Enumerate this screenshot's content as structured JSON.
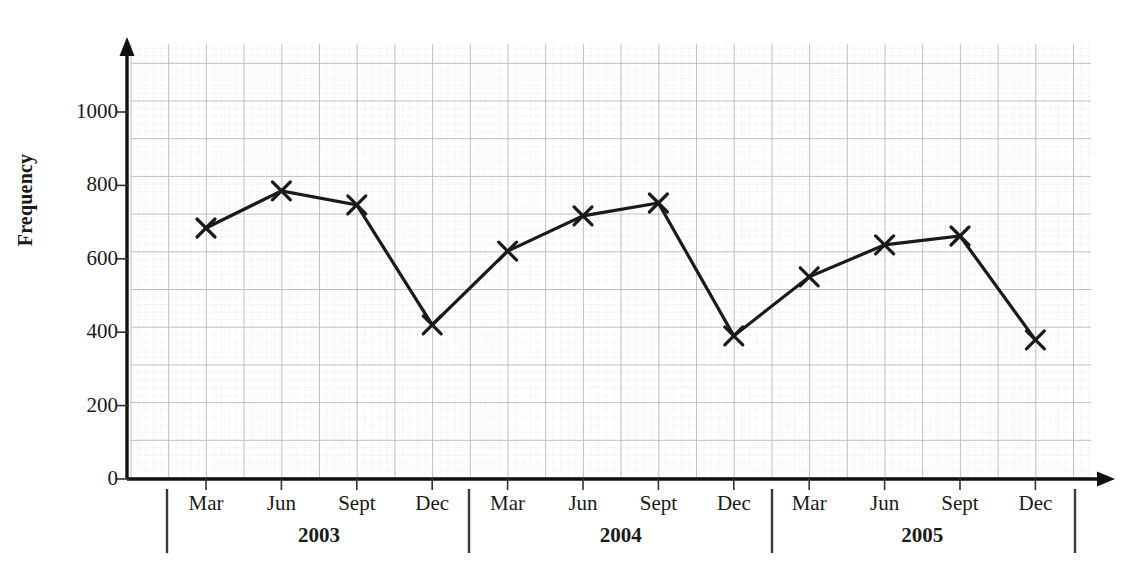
{
  "chart_data": {
    "type": "line",
    "title": "",
    "xlabel": "",
    "ylabel": "Frequency",
    "ylim": [
      0,
      1150
    ],
    "y_ticks": [
      0,
      200,
      400,
      600,
      800,
      1000
    ],
    "y_tick_labels": [
      "0",
      "200",
      "400",
      "600",
      "800",
      "1000"
    ],
    "grid": true,
    "legend": "none",
    "marker": "x",
    "line_color": "#1a1a1a",
    "grid_major_color": "#b9b9bd",
    "grid_minor_color": "#d8d8dd",
    "axis_color": "#111111",
    "categories": [
      "Mar 2003",
      "Jun 2003",
      "Sept 2003",
      "Dec 2003",
      "Mar 2004",
      "Jun 2004",
      "Sept 2004",
      "Dec 2004",
      "Mar 2005",
      "Jun 2005",
      "Sept 2005",
      "Dec 2005"
    ],
    "x_tick_labels": [
      "Mar",
      "Jun",
      "Sept",
      "Dec",
      "Mar",
      "Jun",
      "Sept",
      "Dec",
      "Mar",
      "Jun",
      "Sept",
      "Dec"
    ],
    "values": [
      684,
      785,
      747,
      420,
      621,
      717,
      752,
      390,
      551,
      638,
      662,
      379
    ],
    "year_groups": [
      {
        "label": "2003",
        "start_index": 0,
        "end_index": 3
      },
      {
        "label": "2004",
        "start_index": 4,
        "end_index": 7
      },
      {
        "label": "2005",
        "start_index": 8,
        "end_index": 11
      }
    ],
    "series": [
      {
        "name": "Frequency",
        "values": [
          684,
          785,
          747,
          420,
          621,
          717,
          752,
          390,
          551,
          638,
          662,
          379
        ]
      }
    ]
  },
  "axes": {
    "y_title": "Frequency",
    "y_ticks": [
      "0",
      "200",
      "400",
      "600",
      "800",
      "1000"
    ],
    "x_ticks": [
      "Mar",
      "Jun",
      "Sept",
      "Dec",
      "Mar",
      "Jun",
      "Sept",
      "Dec",
      "Mar",
      "Jun",
      "Sept",
      "Dec"
    ],
    "years": [
      "2003",
      "2004",
      "2005"
    ]
  }
}
